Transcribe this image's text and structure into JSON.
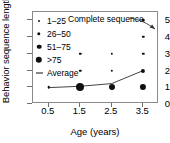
{
  "chart_data": {
    "type": "scatter",
    "title": "",
    "xlabel": "Age (years)",
    "ylabel": "Behavior sequence length",
    "xlim": [
      0,
      4
    ],
    "ylim": [
      0,
      5.5
    ],
    "xticks": [
      "0.5",
      "1.5",
      "2.5",
      "3.5"
    ],
    "xtick_values": [
      0.5,
      1.5,
      2.5,
      3.5
    ],
    "yticks": [
      "0",
      "1",
      "2",
      "3",
      "4",
      "5"
    ],
    "ytick_values": [
      0,
      1,
      2,
      3,
      4,
      5
    ],
    "grid": false,
    "legend_position": "top-left",
    "legend": [
      {
        "label": "1–25",
        "marker": "dot",
        "size": 2.0
      },
      {
        "label": "26–50",
        "marker": "dot",
        "size": 3.4
      },
      {
        "label": "51–75",
        "marker": "dot",
        "size": 4.6
      },
      {
        "label": ">75",
        "marker": "dot",
        "size": 6.4
      },
      {
        "label": "Average",
        "marker": "dash",
        "size": 0
      }
    ],
    "points": [
      {
        "x": 0.5,
        "y": 1,
        "bin": ">75",
        "size": 2.6
      },
      {
        "x": 1.5,
        "y": 1,
        "bin": ">75",
        "size": 8.0
      },
      {
        "x": 1.5,
        "y": 2,
        "bin": "1–25",
        "size": 2.4
      },
      {
        "x": 1.5,
        "y": 3,
        "bin": "1–25",
        "size": 2.4
      },
      {
        "x": 2.5,
        "y": 1,
        "bin": "51–75",
        "size": 6.0
      },
      {
        "x": 2.5,
        "y": 2,
        "bin": "1–25",
        "size": 2.4
      },
      {
        "x": 2.5,
        "y": 3,
        "bin": "1–25",
        "size": 2.4
      },
      {
        "x": 3.5,
        "y": 1,
        "bin": "51–75",
        "size": 6.2
      },
      {
        "x": 3.5,
        "y": 2,
        "bin": "26–50",
        "size": 4.2
      },
      {
        "x": 3.5,
        "y": 3,
        "bin": "1–25",
        "size": 2.4
      },
      {
        "x": 3.5,
        "y": 4,
        "bin": "1–25",
        "size": 2.4
      },
      {
        "x": 3.5,
        "y": 5,
        "bin": "1–25",
        "size": 2.6
      }
    ],
    "series": [
      {
        "name": "Average",
        "type": "line",
        "x": [
          0.5,
          1.5,
          2.5,
          3.5
        ],
        "values": [
          0.98,
          1.06,
          1.22,
          2.0
        ]
      }
    ],
    "annotations": [
      {
        "text": "Complete sequence",
        "points_to_x": 3.5,
        "points_to_y": 5
      }
    ],
    "colors": {
      "marker": "#101010",
      "line": "#444444",
      "frame": "#8a8a8a",
      "text": "#000000"
    }
  }
}
